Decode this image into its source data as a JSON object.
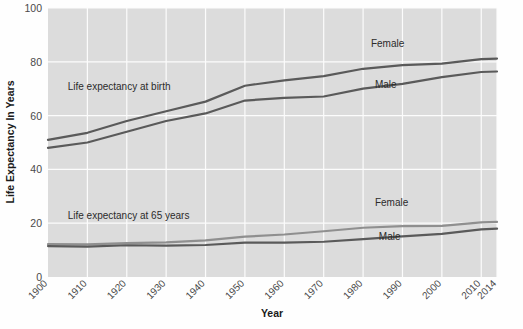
{
  "chart_data": {
    "type": "line",
    "title": "",
    "xlabel": "Year",
    "ylabel": "Life Expectancy In Years",
    "grid": true,
    "legend": "inline-annotations",
    "xlim": [
      1900,
      2014
    ],
    "ylim": [
      0,
      100
    ],
    "ytick_labels": [
      "0",
      "20",
      "40",
      "60",
      "80",
      "100"
    ],
    "yticks": [
      0,
      20,
      40,
      60,
      80,
      100
    ],
    "xtick_labels": [
      "1900",
      "1910",
      "1920",
      "1930",
      "1940",
      "1950",
      "1960",
      "1970",
      "1980",
      "1990",
      "2000",
      "2010",
      "2014"
    ],
    "xticks": [
      1900,
      1910,
      1920,
      1930,
      1940,
      1950,
      1960,
      1970,
      1980,
      1990,
      2000,
      2010,
      2014
    ],
    "x": [
      1900,
      1910,
      1920,
      1930,
      1940,
      1950,
      1960,
      1970,
      1980,
      1990,
      2000,
      2010,
      2014
    ],
    "series": [
      {
        "name": "Life expectancy at birth - Female",
        "group": "at birth",
        "sex": "Female",
        "color": "#5a5a5a",
        "values": [
          51.0,
          53.6,
          58.0,
          61.6,
          65.2,
          71.1,
          73.1,
          74.7,
          77.4,
          78.8,
          79.3,
          81.0,
          81.2
        ]
      },
      {
        "name": "Life expectancy at birth - Male",
        "group": "at birth",
        "sex": "Male",
        "color": "#5a5a5a",
        "values": [
          48.0,
          50.0,
          54.0,
          58.0,
          60.8,
          65.6,
          66.6,
          67.1,
          70.0,
          71.8,
          74.3,
          76.2,
          76.4
        ]
      },
      {
        "name": "Life expectancy at 65 years - Female",
        "group": "at 65 years",
        "sex": "Female",
        "color": "#8f8f8f",
        "values": [
          12.2,
          12.1,
          12.6,
          12.9,
          13.6,
          15.0,
          15.8,
          17.0,
          18.3,
          18.9,
          19.0,
          20.3,
          20.5
        ]
      },
      {
        "name": "Life expectancy at 65 years - Male",
        "group": "at 65 years",
        "sex": "Male",
        "color": "#5a5a5a",
        "values": [
          11.5,
          11.3,
          11.8,
          11.7,
          11.9,
          12.8,
          12.8,
          13.1,
          14.1,
          15.1,
          16.0,
          17.7,
          18.0
        ]
      }
    ],
    "annotations": [
      {
        "id": "birth-group-label",
        "text": "Life expectancy at birth",
        "x": 1905,
        "y": 69.5
      },
      {
        "id": "at65-group-label",
        "text": "Life expectancy at 65 years",
        "x": 1905,
        "y": 21.5
      },
      {
        "id": "birth-female-label",
        "text": "Female",
        "x": 1982,
        "y": 85.5
      },
      {
        "id": "birth-male-label",
        "text": "Male",
        "x": 1983,
        "y": 70.2
      },
      {
        "id": "at65-female-label",
        "text": "Female",
        "x": 1983,
        "y": 26.5
      },
      {
        "id": "at65-male-label",
        "text": "Male",
        "x": 1984,
        "y": 13.8
      }
    ],
    "colors": {
      "plot_background": "#dcdcdc",
      "gridlines": "#fcfcfc",
      "dark_series": "#5a5a5a",
      "light_series": "#8f8f8f",
      "text": "#3a3a3a"
    }
  }
}
